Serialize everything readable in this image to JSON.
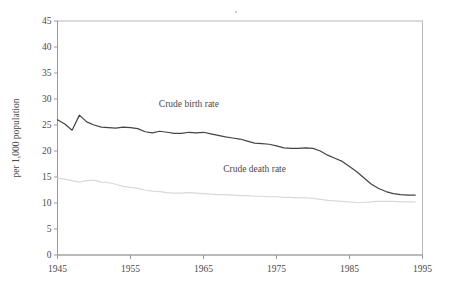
{
  "chart_data": {
    "type": "line",
    "title": "",
    "xlabel": "",
    "ylabel": "per 1,000 population",
    "xlim": [
      1945,
      1995
    ],
    "ylim": [
      0,
      45
    ],
    "xticks": [
      1945,
      1955,
      1965,
      1975,
      1985,
      1995
    ],
    "yticks": [
      0,
      5,
      10,
      15,
      20,
      25,
      30,
      35,
      40,
      45
    ],
    "grid": false,
    "legend": "inline-annotations",
    "annotations": [
      {
        "text": "Crude birth rate",
        "x": 1963,
        "y": 28.5
      },
      {
        "text": "Crude death rate",
        "x": 1972,
        "y": 16.0
      }
    ],
    "x": [
      1945,
      1946,
      1947,
      1948,
      1949,
      1950,
      1951,
      1952,
      1953,
      1954,
      1955,
      1956,
      1957,
      1958,
      1959,
      1960,
      1961,
      1962,
      1963,
      1964,
      1965,
      1966,
      1967,
      1968,
      1969,
      1970,
      1971,
      1972,
      1973,
      1974,
      1975,
      1976,
      1977,
      1978,
      1979,
      1980,
      1981,
      1982,
      1983,
      1984,
      1985,
      1986,
      1987,
      1988,
      1989,
      1990,
      1991,
      1992,
      1993,
      1994
    ],
    "series": [
      {
        "name": "Crude birth rate",
        "color": "#444444",
        "values": [
          26.0,
          25.2,
          24.0,
          26.9,
          25.6,
          25.0,
          24.6,
          24.5,
          24.4,
          24.6,
          24.5,
          24.3,
          23.7,
          23.5,
          23.8,
          23.6,
          23.4,
          23.4,
          23.6,
          23.5,
          23.6,
          23.3,
          23.0,
          22.7,
          22.5,
          22.3,
          21.9,
          21.5,
          21.4,
          21.3,
          21.0,
          20.6,
          20.5,
          20.5,
          20.6,
          20.5,
          20.0,
          19.2,
          18.6,
          18.0,
          17.0,
          16.0,
          14.8,
          13.6,
          12.8,
          12.2,
          11.8,
          11.6,
          11.5,
          11.5
        ]
      },
      {
        "name": "Crude death rate",
        "color": "#d9d9d9",
        "values": [
          14.8,
          14.6,
          14.3,
          14.0,
          14.3,
          14.4,
          14.0,
          13.9,
          13.6,
          13.2,
          13.0,
          12.8,
          12.5,
          12.3,
          12.2,
          12.0,
          11.9,
          11.9,
          12.0,
          11.9,
          11.8,
          11.7,
          11.6,
          11.6,
          11.5,
          11.4,
          11.4,
          11.3,
          11.3,
          11.2,
          11.2,
          11.1,
          11.1,
          11.0,
          11.0,
          10.9,
          10.7,
          10.5,
          10.4,
          10.3,
          10.2,
          10.1,
          10.1,
          10.2,
          10.3,
          10.3,
          10.3,
          10.2,
          10.2,
          10.2
        ]
      }
    ]
  }
}
